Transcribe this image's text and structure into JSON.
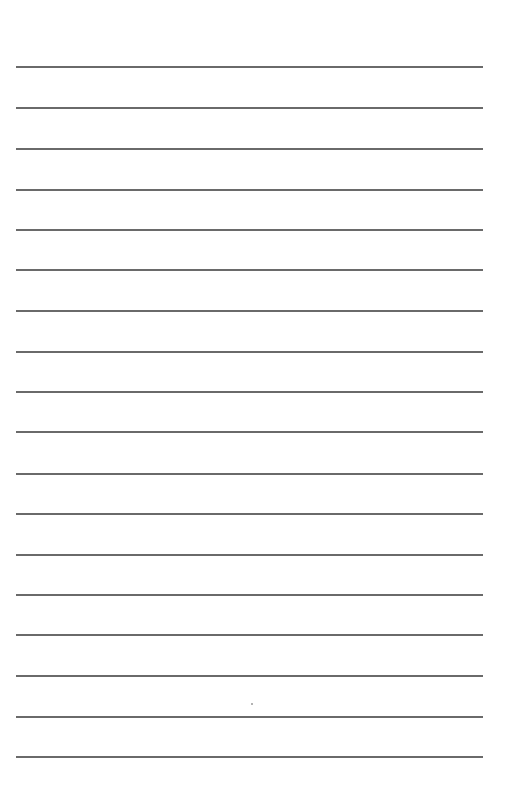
{
  "page": {
    "type": "lined-paper",
    "background_color": "#ffffff",
    "line_color": "#5a5a5a",
    "line_left_px": 16,
    "line_right_px": 483,
    "line_count": 18,
    "line_y_positions": [
      66,
      107,
      148,
      189,
      229,
      269,
      310,
      351,
      391,
      431,
      473,
      513,
      554,
      594,
      634,
      675,
      716,
      756
    ],
    "specks": [
      {
        "x": 251,
        "y": 703
      }
    ]
  }
}
